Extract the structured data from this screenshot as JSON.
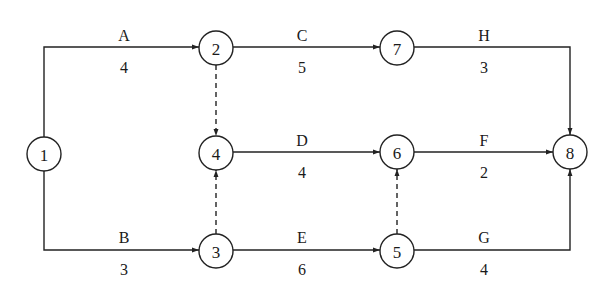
{
  "diagram": {
    "type": "activity-on-arrow network",
    "nodes": [
      {
        "id": "1",
        "label": "1",
        "x": 44,
        "y": 154
      },
      {
        "id": "2",
        "label": "2",
        "x": 216,
        "y": 48
      },
      {
        "id": "3",
        "label": "3",
        "x": 216,
        "y": 251
      },
      {
        "id": "4",
        "label": "4",
        "x": 216,
        "y": 153
      },
      {
        "id": "5",
        "label": "5",
        "x": 397,
        "y": 251
      },
      {
        "id": "6",
        "label": "6",
        "x": 397,
        "y": 152
      },
      {
        "id": "7",
        "label": "7",
        "x": 397,
        "y": 48
      },
      {
        "id": "8",
        "label": "8",
        "x": 570,
        "y": 152
      }
    ],
    "activities": [
      {
        "name": "A",
        "duration": "4",
        "from": "1",
        "to": "2"
      },
      {
        "name": "B",
        "duration": "3",
        "from": "1",
        "to": "3"
      },
      {
        "name": "C",
        "duration": "5",
        "from": "2",
        "to": "7"
      },
      {
        "name": "D",
        "duration": "4",
        "from": "4",
        "to": "6"
      },
      {
        "name": "E",
        "duration": "6",
        "from": "3",
        "to": "5"
      },
      {
        "name": "F",
        "duration": "2",
        "from": "6",
        "to": "8"
      },
      {
        "name": "G",
        "duration": "4",
        "from": "5",
        "to": "8"
      },
      {
        "name": "H",
        "duration": "3",
        "from": "7",
        "to": "8"
      }
    ],
    "dummy_activities": [
      {
        "from": "2",
        "to": "4"
      },
      {
        "from": "3",
        "to": "4"
      },
      {
        "from": "5",
        "to": "6"
      }
    ],
    "labels": {
      "A": {
        "name": "A",
        "duration": "4"
      },
      "B": {
        "name": "B",
        "duration": "3"
      },
      "C": {
        "name": "C",
        "duration": "5"
      },
      "D": {
        "name": "D",
        "duration": "4"
      },
      "E": {
        "name": "E",
        "duration": "6"
      },
      "F": {
        "name": "F",
        "duration": "2"
      },
      "G": {
        "name": "G",
        "duration": "4"
      },
      "H": {
        "name": "H",
        "duration": "3"
      }
    },
    "node_labels": {
      "n1": "1",
      "n2": "2",
      "n3": "3",
      "n4": "4",
      "n5": "5",
      "n6": "6",
      "n7": "7",
      "n8": "8"
    }
  }
}
